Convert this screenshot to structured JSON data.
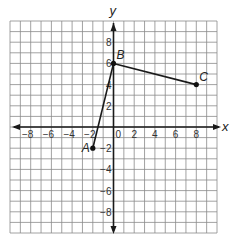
{
  "diagram": {
    "type": "coordinate-plane",
    "axes": {
      "x_label": "x",
      "y_label": "y"
    },
    "range": {
      "x": [
        -10,
        10
      ],
      "y": [
        -10,
        10
      ]
    },
    "grid_step": 1,
    "x_ticks": [
      {
        "value": -8,
        "label": "−8"
      },
      {
        "value": -6,
        "label": "−6"
      },
      {
        "value": -4,
        "label": "−4"
      },
      {
        "value": -2,
        "label": "−2"
      },
      {
        "value": 0,
        "label": "0"
      },
      {
        "value": 2,
        "label": "2"
      },
      {
        "value": 4,
        "label": "4"
      },
      {
        "value": 6,
        "label": "6"
      },
      {
        "value": 8,
        "label": "8"
      }
    ],
    "y_ticks": [
      {
        "value": 8,
        "label": "8"
      },
      {
        "value": 6,
        "label": "6"
      },
      {
        "value": 4,
        "label": "4"
      },
      {
        "value": 2,
        "label": "2"
      },
      {
        "value": -2,
        "label": "−2"
      },
      {
        "value": -4,
        "label": "−4"
      },
      {
        "value": -6,
        "label": "−6"
      },
      {
        "value": -8,
        "label": "−8"
      }
    ],
    "points": [
      {
        "name": "A",
        "x": -2,
        "y": -2
      },
      {
        "name": "B",
        "x": 0,
        "y": 6
      },
      {
        "name": "C",
        "x": 8,
        "y": 4
      }
    ],
    "segments": [
      [
        "A",
        "B"
      ],
      [
        "B",
        "C"
      ]
    ],
    "colors": {
      "grid": "#8a8a8a",
      "ink": "#1a1a1a"
    }
  }
}
